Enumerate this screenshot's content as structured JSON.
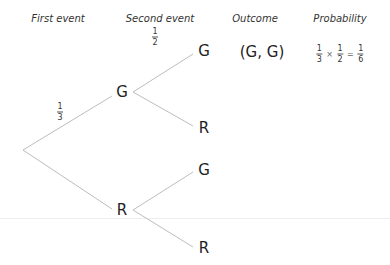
{
  "headers": {
    "first_event": "First event",
    "second_event": "Second event",
    "outcome": "Outcome",
    "probability": "Probability"
  },
  "tree": {
    "first_level": [
      {
        "label": "G",
        "branch_probability": {
          "num": "1",
          "den": "3"
        }
      },
      {
        "label": "R"
      }
    ],
    "second_level": {
      "after_G": [
        {
          "label": "G",
          "branch_probability": {
            "num": "1",
            "den": "2"
          }
        },
        {
          "label": "R"
        }
      ],
      "after_R": [
        {
          "label": "G"
        },
        {
          "label": "R"
        }
      ]
    }
  },
  "outcomes": [
    {
      "outcome": "(G, G)",
      "probability": {
        "f1": {
          "num": "1",
          "den": "3"
        },
        "times": "×",
        "f2": {
          "num": "1",
          "den": "2"
        },
        "equals": "=",
        "result": {
          "num": "1",
          "den": "6"
        }
      }
    }
  ],
  "colors": {
    "branch_line": "#bbbbbb",
    "text": "#222222",
    "divider": "#eeeeee"
  }
}
